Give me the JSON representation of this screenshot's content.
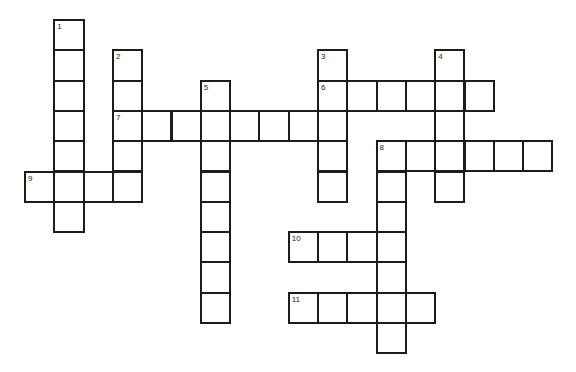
{
  "puzzle": {
    "type": "crossword",
    "grid_origin": [
      25,
      20
    ],
    "cell_w": 29.3,
    "cell_h": 30.3,
    "border_color": "#1c1c1c",
    "background": "#ffffff"
  },
  "entries": [
    {
      "number": "1",
      "direction": "down",
      "row": 0,
      "col": 1,
      "length": 7
    },
    {
      "number": "2",
      "direction": "down",
      "row": 1,
      "col": 3,
      "length": 5
    },
    {
      "number": "3",
      "direction": "down",
      "row": 1,
      "col": 10,
      "length": 5
    },
    {
      "number": "4",
      "direction": "down",
      "row": 1,
      "col": 14,
      "length": 5
    },
    {
      "number": "5",
      "direction": "down",
      "row": 2,
      "col": 6,
      "length": 8
    },
    {
      "number": "6",
      "direction": "across",
      "row": 2,
      "col": 10,
      "length": 6
    },
    {
      "number": "7",
      "direction": "across",
      "row": 3,
      "col": 3,
      "length": 8
    },
    {
      "number": "8",
      "direction": "across",
      "row": 4,
      "col": 12,
      "length": 6
    },
    {
      "number": "8",
      "direction": "down",
      "row": 4,
      "col": 12,
      "length": 7
    },
    {
      "number": "9",
      "direction": "across",
      "row": 5,
      "col": 0,
      "length": 4
    },
    {
      "number": "10",
      "direction": "across",
      "row": 7,
      "col": 9,
      "length": 4
    },
    {
      "number": "11",
      "direction": "across",
      "row": 9,
      "col": 9,
      "length": 5
    }
  ]
}
